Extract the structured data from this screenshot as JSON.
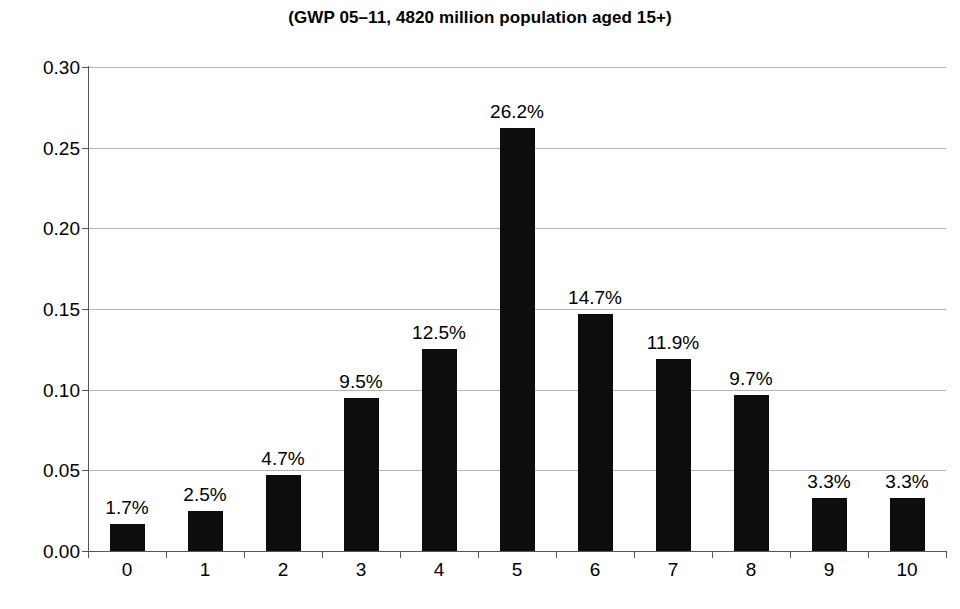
{
  "chart_data": {
    "type": "bar",
    "title": "(GWP 05–11, 4820 million population aged 15+)",
    "xlabel": "",
    "ylabel": "",
    "categories": [
      "0",
      "1",
      "2",
      "3",
      "4",
      "5",
      "6",
      "7",
      "8",
      "9",
      "10"
    ],
    "values": [
      0.017,
      0.025,
      0.047,
      0.095,
      0.125,
      0.262,
      0.147,
      0.119,
      0.097,
      0.033,
      0.033
    ],
    "data_labels": [
      "1.7%",
      "2.5%",
      "4.7%",
      "9.5%",
      "12.5%",
      "26.2%",
      "14.7%",
      "11.9%",
      "9.7%",
      "3.3%",
      "3.3%"
    ],
    "ylim": [
      0.0,
      0.3
    ],
    "ytick_values": [
      0.0,
      0.05,
      0.1,
      0.15,
      0.2,
      0.25,
      0.3
    ],
    "ytick_labels": [
      "0.00",
      "0.05",
      "0.10",
      "0.15",
      "0.20",
      "0.25",
      "0.30"
    ],
    "grid": true,
    "legend": "none",
    "bar_color": "#0d0d0d",
    "gridline_color": "#b4b4b4",
    "axis_color": "#555555"
  }
}
